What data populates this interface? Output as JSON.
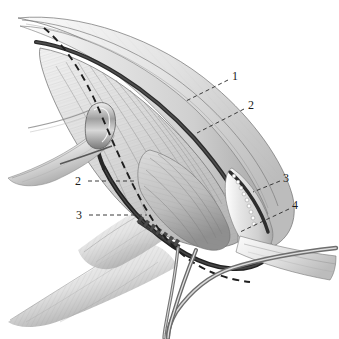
{
  "figure": {
    "medium": "grayscale pen-and-ink anatomical drawing",
    "background_color": "#ffffff",
    "width": 339,
    "height": 339,
    "palette": {
      "ink": "#1a1a1a",
      "incision_dark": "#2a2a2a",
      "tissue_light": "#e2e2e2",
      "tissue_mid": "#c9c9c9",
      "tissue_shadow": "#9a9a9a",
      "instrument_steel": "#b5b5b5",
      "suture_dot": "#ffffff",
      "leader_line": "#3a3a3a"
    }
  },
  "callouts": [
    {
      "id": "callout-1",
      "label": "1",
      "label_x": 232,
      "label_y": 70,
      "leader_from_x": 228,
      "leader_from_y": 80,
      "leader_to_x": 186,
      "leader_to_y": 101
    },
    {
      "id": "callout-2-right",
      "label": "2",
      "label_x": 248,
      "label_y": 99,
      "leader_from_x": 244,
      "leader_from_y": 109,
      "leader_to_x": 197,
      "leader_to_y": 133
    },
    {
      "id": "callout-3-right",
      "label": "3",
      "label_x": 283,
      "label_y": 172,
      "leader_from_x": 280,
      "leader_from_y": 181,
      "leader_to_x": 253,
      "leader_to_y": 192
    },
    {
      "id": "callout-4-right",
      "label": "4",
      "label_x": 292,
      "label_y": 199,
      "leader_from_x": 289,
      "leader_from_y": 209,
      "leader_to_x": 240,
      "leader_to_y": 232
    },
    {
      "id": "callout-2-left",
      "label": "2",
      "label_x": 75,
      "label_y": 175,
      "leader_from_x": 88,
      "leader_from_y": 181,
      "leader_to_x": 137,
      "leader_to_y": 181
    },
    {
      "id": "callout-3-left",
      "label": "3",
      "label_x": 76,
      "label_y": 209,
      "leader_from_x": 89,
      "leader_from_y": 215,
      "leader_to_x": 147,
      "leader_to_y": 215
    }
  ],
  "features": {
    "dashed_incision_plane": "long dashed curve tracing the dissection plane from upper-left apex down to lower-right",
    "suture_dots": "row of small white suture/clip dots along right incision margin",
    "serrated_retractor_edge": "toothed retractor edge along lower-left wound margin",
    "instrument_shafts": "two slender metal instrument shafts entering from lower edge",
    "retractor_hook_left": "retractor blade and hook at mid-left holding tissue open",
    "fan_shading_lower_left": "fine hatched fan of shading at lower left"
  }
}
